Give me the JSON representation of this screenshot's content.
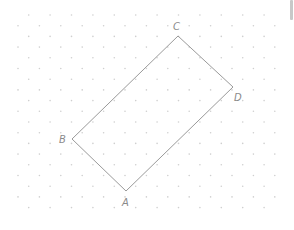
{
  "figure": {
    "type": "rectangle-on-dot-grid",
    "grid": {
      "x_start": 18,
      "y_start": 15,
      "step": 10.7,
      "cols": 25,
      "rows": 19,
      "dot_color": "#cfcfcf"
    },
    "shape": {
      "stroke": "#9a9a9a",
      "vertices": [
        {
          "name": "A",
          "x": 126,
          "y": 191,
          "label_x": 122,
          "label_y": 206
        },
        {
          "name": "B",
          "x": 72,
          "y": 139,
          "label_x": 59,
          "label_y": 143
        },
        {
          "name": "C",
          "x": 178,
          "y": 36,
          "label_x": 173,
          "label_y": 30
        },
        {
          "name": "D",
          "x": 233,
          "y": 87,
          "label_x": 234,
          "label_y": 101
        }
      ]
    },
    "labels": {
      "A": "A",
      "B": "B",
      "C": "C",
      "D": "D"
    }
  }
}
